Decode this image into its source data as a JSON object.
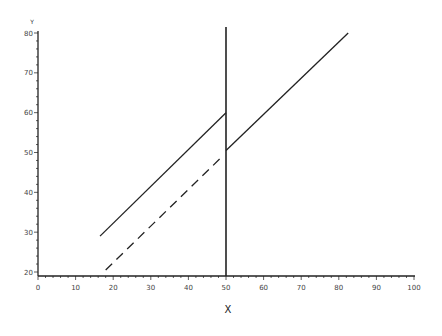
{
  "chart_data": {
    "type": "line",
    "title": "",
    "xlabel": "X",
    "ylabel": "Y",
    "xlim": [
      0,
      100
    ],
    "ylim": [
      20,
      80
    ],
    "x_ticks": [
      0,
      10,
      20,
      30,
      40,
      50,
      60,
      70,
      80,
      90,
      100
    ],
    "y_ticks": [
      20,
      30,
      40,
      50,
      60,
      70,
      80
    ],
    "grid": false,
    "legend": null,
    "series": [
      {
        "name": "upper-left-solid",
        "style": "solid",
        "x": [
          16.5,
          50
        ],
        "y": [
          29,
          60
        ]
      },
      {
        "name": "lower-left-dashed",
        "style": "dashed",
        "x": [
          18,
          49
        ],
        "y": [
          20.5,
          49
        ]
      },
      {
        "name": "right-solid",
        "style": "solid",
        "x": [
          50,
          82.5
        ],
        "y": [
          50.5,
          80
        ]
      },
      {
        "name": "vertical-cutoff",
        "style": "solid",
        "x": [
          50,
          50
        ],
        "y": [
          19,
          81.5
        ]
      }
    ]
  },
  "axes": {
    "x_title": "X",
    "y_title": "Y",
    "x_tick_labels": [
      "0",
      "10",
      "20",
      "30",
      "40",
      "50",
      "60",
      "70",
      "80",
      "90",
      "100"
    ],
    "y_tick_labels": [
      "20",
      "30",
      "40",
      "50",
      "60",
      "70",
      "80"
    ]
  }
}
